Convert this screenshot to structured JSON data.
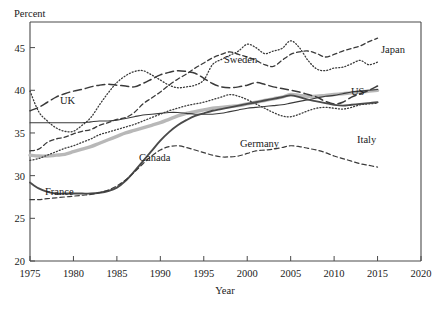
{
  "chart_data": {
    "type": "line",
    "title": "",
    "ylabel": "Percent",
    "xlabel": "Year",
    "xlim": [
      1975,
      2020
    ],
    "ylim": [
      20,
      48
    ],
    "xticks": [
      1975,
      1980,
      1985,
      1990,
      1995,
      2000,
      2005,
      2010,
      2015,
      2020
    ],
    "yticks": [
      20,
      25,
      30,
      35,
      40,
      45
    ],
    "grid": false,
    "legend": "inline-labels",
    "x": [
      1975,
      1976,
      1977,
      1978,
      1979,
      1980,
      1981,
      1982,
      1983,
      1984,
      1985,
      1986,
      1987,
      1988,
      1989,
      1990,
      1991,
      1992,
      1993,
      1994,
      1995,
      1996,
      1997,
      1998,
      1999,
      2000,
      2001,
      2002,
      2003,
      2004,
      2005,
      2006,
      2007,
      2008,
      2009,
      2010,
      2011,
      2012,
      2013,
      2014,
      2015
    ],
    "series": [
      {
        "name": "Sweden",
        "style": "dotted",
        "color": "#3a3a3a",
        "width": 1.3,
        "values": [
          39.9,
          37.5,
          36.4,
          35.6,
          35.2,
          35.2,
          35.9,
          36.8,
          38.3,
          39.7,
          40.9,
          41.7,
          42.2,
          42.3,
          41.8,
          41.2,
          40.6,
          40.3,
          40.4,
          40.6,
          41.2,
          43.0,
          43.6,
          44.1,
          44.6,
          45.4,
          45.0,
          44.3,
          44.6,
          44.9,
          45.8,
          45.0,
          43.5,
          42.5,
          42.3,
          42.6,
          42.7,
          43.1,
          43.5,
          43.0,
          43.3
        ]
      },
      {
        "name": "Japan",
        "style": "dashed",
        "color": "#3a3a3a",
        "width": 1.3,
        "values": [
          32.9,
          33.1,
          33.9,
          34.3,
          34.5,
          34.9,
          35.2,
          35.4,
          35.9,
          36.2,
          36.6,
          36.8,
          37.4,
          38.4,
          39.1,
          39.8,
          40.6,
          41.3,
          41.9,
          42.6,
          43.2,
          43.8,
          44.2,
          44.5,
          44.2,
          43.9,
          43.5,
          43.0,
          42.8,
          43.5,
          44.2,
          44.5,
          44.6,
          44.3,
          43.9,
          44.2,
          44.6,
          44.9,
          45.2,
          45.7,
          46.1
        ]
      },
      {
        "name": "UK",
        "style": "longdash",
        "color": "#3a3a3a",
        "width": 1.5,
        "values": [
          37.6,
          38.0,
          38.6,
          39.2,
          39.6,
          39.9,
          40.1,
          40.4,
          40.6,
          40.7,
          40.6,
          40.5,
          40.4,
          40.8,
          41.3,
          41.8,
          42.1,
          42.3,
          42.2,
          42.0,
          41.4,
          40.8,
          40.4,
          40.3,
          40.4,
          40.6,
          40.9,
          40.7,
          40.4,
          40.2,
          40.0,
          39.8,
          39.5,
          39.2,
          38.7,
          38.4,
          38.6,
          39.2,
          39.6,
          40.0,
          40.5
        ]
      },
      {
        "name": "US",
        "style": "solid-thin",
        "color": "#3a3a3a",
        "width": 1.1,
        "values": [
          36.2,
          36.2,
          36.2,
          36.2,
          36.2,
          36.2,
          36.2,
          36.3,
          36.4,
          36.4,
          36.5,
          36.7,
          36.9,
          37.1,
          37.2,
          37.3,
          37.4,
          37.4,
          37.3,
          37.2,
          37.2,
          37.2,
          37.3,
          37.5,
          37.7,
          37.9,
          38.0,
          38.1,
          38.2,
          38.3,
          38.5,
          38.7,
          38.9,
          39.1,
          39.3,
          39.4,
          39.6,
          39.8,
          39.9,
          40.0,
          40.1
        ]
      },
      {
        "name": "Germany",
        "style": "thick-gray",
        "color": "#b8b8b8",
        "width": 3.4,
        "values": [
          32.4,
          32.3,
          32.3,
          32.4,
          32.5,
          32.8,
          33.1,
          33.4,
          33.8,
          34.2,
          34.6,
          35.0,
          35.3,
          35.6,
          35.9,
          36.2,
          36.6,
          37.0,
          37.3,
          37.5,
          37.7,
          37.9,
          38.0,
          38.1,
          38.2,
          38.4,
          38.6,
          38.8,
          39.0,
          39.2,
          39.5,
          39.4,
          39.3,
          39.3,
          39.4,
          39.5,
          39.6,
          39.7,
          39.8,
          39.9,
          40.0
        ]
      },
      {
        "name": "Italy",
        "style": "dotted",
        "color": "#3a3a3a",
        "width": 1.3,
        "values": [
          31.8,
          32.0,
          32.4,
          32.8,
          33.2,
          33.5,
          33.9,
          34.3,
          34.8,
          35.1,
          35.4,
          35.7,
          36.0,
          36.4,
          36.8,
          37.2,
          37.6,
          37.9,
          38.2,
          38.4,
          38.6,
          38.9,
          39.2,
          39.5,
          39.3,
          38.9,
          38.4,
          37.9,
          37.4,
          37.0,
          36.9,
          37.2,
          37.6,
          37.9,
          38.0,
          37.9,
          37.8,
          38.0,
          38.3,
          38.4,
          38.5
        ]
      },
      {
        "name": "France",
        "style": "solid-bold",
        "color": "#4a4a4a",
        "width": 1.9,
        "values": [
          29.2,
          28.5,
          28.1,
          27.9,
          27.9,
          27.9,
          27.9,
          27.9,
          28.0,
          28.2,
          28.6,
          29.4,
          30.5,
          31.7,
          32.9,
          34.1,
          35.1,
          35.9,
          36.5,
          37.0,
          37.3,
          37.6,
          37.8,
          38.0,
          38.2,
          38.4,
          38.6,
          38.8,
          39.0,
          39.2,
          39.4,
          39.2,
          38.9,
          38.7,
          38.5,
          38.3,
          38.2,
          38.3,
          38.4,
          38.5,
          38.6
        ]
      },
      {
        "name": "Canada",
        "style": "dashed",
        "color": "#3a3a3a",
        "width": 1.2,
        "values": [
          27.2,
          27.2,
          27.3,
          27.4,
          27.5,
          27.6,
          27.7,
          27.8,
          28.0,
          28.3,
          28.8,
          29.5,
          30.4,
          31.4,
          32.3,
          33.0,
          33.4,
          33.5,
          33.3,
          33.0,
          32.7,
          32.4,
          32.2,
          32.2,
          32.3,
          32.6,
          32.9,
          33.0,
          33.1,
          33.3,
          33.5,
          33.4,
          33.2,
          33.0,
          32.7,
          32.3,
          32.0,
          31.7,
          31.4,
          31.2,
          31.0
        ]
      }
    ],
    "annotations": [
      {
        "label": "Sweden",
        "x": 224,
        "y": 63
      },
      {
        "label": "Japan",
        "x": 381,
        "y": 53
      },
      {
        "label": "UK",
        "x": 60,
        "y": 104
      },
      {
        "label": "US",
        "x": 351,
        "y": 95
      },
      {
        "label": "Germany",
        "x": 240,
        "y": 147
      },
      {
        "label": "Italy",
        "x": 357,
        "y": 143
      },
      {
        "label": "France",
        "x": 45,
        "y": 195
      },
      {
        "label": "Canada",
        "x": 139,
        "y": 161
      }
    ]
  }
}
